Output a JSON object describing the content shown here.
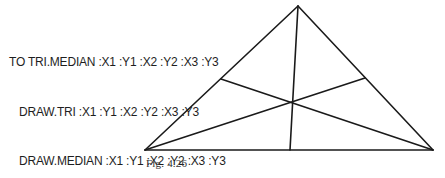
{
  "procedure": {
    "lines": [
      "TO TRI.MEDIAN :X1 :Y1 :X2 :Y2 :X3 :Y3",
      "DRAW.TRI :X1 :Y1 :X2 :Y2 :X3 :Y3",
      "DRAW.MEDIAN :X1 :Y1 :X2 :Y2 :X3 :Y3",
      "END"
    ]
  },
  "figure": {
    "caption": "Fig. 4.26",
    "stroke_color": "#1a1a1a",
    "vertices": {
      "top": [
        298,
        6
      ],
      "bottom_left": [
        145,
        150
      ],
      "bottom_right": [
        433,
        150
      ]
    },
    "midpoints": {
      "left_side": [
        221,
        79
      ],
      "right_side": [
        365,
        78
      ],
      "base": [
        290,
        150
      ]
    },
    "centroid": [
      292,
      102
    ]
  }
}
